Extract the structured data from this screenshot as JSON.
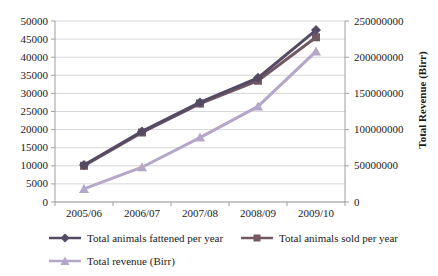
{
  "chart_data": {
    "type": "line",
    "title": "",
    "xlabel": "",
    "ylabel": "",
    "y2label": "Total Revenue (Birr)",
    "grid": true,
    "legend_position": "bottom",
    "categories": [
      "2005/06",
      "2006/07",
      "2007/08",
      "2008/09",
      "2009/10"
    ],
    "series": [
      {
        "name": "Total animals fattened per year",
        "marker": "diamond",
        "axis": "left",
        "color": "#544a63",
        "values": [
          10200,
          19500,
          27500,
          34300,
          47500
        ]
      },
      {
        "name": "Total animals sold per year",
        "marker": "square",
        "axis": "left",
        "color": "#715862",
        "values": [
          10000,
          19200,
          27200,
          33500,
          45500
        ]
      },
      {
        "name": "Total revenue (Birr)",
        "marker": "triangle",
        "axis": "right",
        "color": "#b4a7c7",
        "values": [
          18000000,
          48000000,
          89000000,
          132000000,
          208000000
        ]
      }
    ],
    "left_axis": {
      "min": 0,
      "max": 50000,
      "step": 5000,
      "tick_labels": [
        "0",
        "5000",
        "10000",
        "15000",
        "20000",
        "25000",
        "30000",
        "35000",
        "40000",
        "45000",
        "50000"
      ]
    },
    "right_axis": {
      "min": 0,
      "max": 250000000,
      "step": 50000000,
      "title": "Total Revenue (Birr)",
      "tick_labels": [
        "0",
        "50000000",
        "100000000",
        "150000000",
        "200000000",
        "250000000"
      ]
    }
  },
  "colors": {
    "gridline": "#d8d8d8",
    "axis": "#a0a0a0",
    "text": "#1a1a1a"
  }
}
